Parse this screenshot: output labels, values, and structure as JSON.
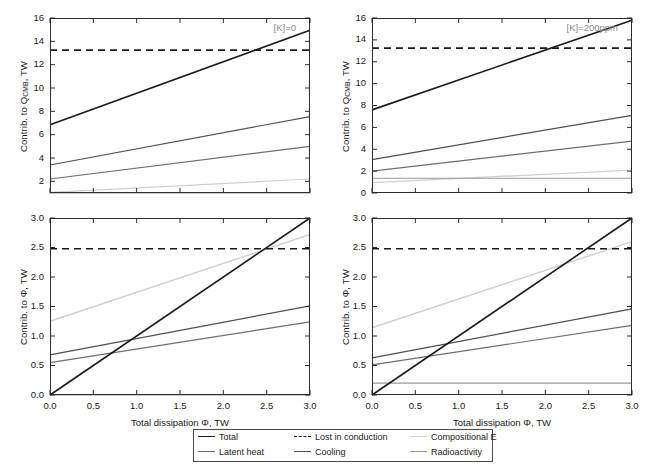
{
  "figure": {
    "background": "#ffffff",
    "width": 648,
    "height": 467
  },
  "series_styles": {
    "total": "#1a1a1a",
    "lost_in_conduction": "#1a1a1a",
    "compositional_e": "#d0d0d0",
    "latent_heat": "#6e6e6e",
    "cooling": "#505050",
    "radioactivity": "#9a9a9a"
  },
  "legend": {
    "entries": [
      {
        "label": "Total",
        "color": "#1a1a1a",
        "style": "solid",
        "icon": "line-solid-icon"
      },
      {
        "label": "Lost in conduction",
        "color": "#1a1a1a",
        "style": "dashed",
        "icon": "line-dashed-icon"
      },
      {
        "label": "Compositional E",
        "color": "#d0d0d0",
        "style": "solid",
        "icon": "line-solid-icon"
      },
      {
        "label": "Latent heat",
        "color": "#6e6e6e",
        "style": "solid",
        "icon": "line-solid-icon"
      },
      {
        "label": "Cooling",
        "color": "#505050",
        "style": "solid",
        "icon": "line-solid-icon"
      },
      {
        "label": "Radioactivity",
        "color": "#9a9a9a",
        "style": "solid",
        "icon": "line-solid-icon"
      }
    ]
  },
  "chart_data": [
    {
      "id": "top-left",
      "type": "line",
      "title": "",
      "annotation": "[K]=0",
      "xlabel": "",
      "ylabel": "Contrib. to Q_CMB, TW",
      "ylabel_parts": {
        "pre": "Contrib. to Q",
        "sub": "CMB",
        "post": ", TW"
      },
      "xlim": [
        0.0,
        3.0
      ],
      "ylim": [
        1.0,
        16.0
      ],
      "xticks": [
        0.0,
        0.5,
        1.0,
        1.5,
        2.0,
        2.5,
        3.0
      ],
      "xticklabels": [
        "",
        "",
        "",
        "",
        "",
        "",
        ""
      ],
      "yticks": [
        2,
        4,
        6,
        8,
        10,
        12,
        14,
        16
      ],
      "yticklabels": [
        "2",
        "4",
        "6",
        "8",
        "10",
        "12",
        "14",
        "16"
      ],
      "grid": false,
      "series": [
        {
          "name": "Total",
          "color": "#1a1a1a",
          "style": "solid",
          "width": 1.6,
          "x": [
            0.0,
            3.0
          ],
          "y": [
            6.85,
            14.95
          ]
        },
        {
          "name": "Lost in conduction",
          "color": "#1a1a1a",
          "style": "dashed",
          "width": 1.6,
          "x": [
            0.0,
            3.0
          ],
          "y": [
            13.25,
            13.25
          ]
        },
        {
          "name": "Cooling",
          "color": "#505050",
          "style": "solid",
          "width": 1.2,
          "x": [
            0.0,
            3.0
          ],
          "y": [
            3.4,
            7.55
          ]
        },
        {
          "name": "Latent heat",
          "color": "#6e6e6e",
          "style": "solid",
          "width": 1.2,
          "x": [
            0.0,
            3.0
          ],
          "y": [
            2.2,
            5.0
          ]
        },
        {
          "name": "Compositional E",
          "color": "#d0d0d0",
          "style": "solid",
          "width": 1.2,
          "x": [
            0.0,
            3.0
          ],
          "y": [
            1.05,
            2.2
          ]
        },
        {
          "name": "Radioactivity",
          "color": "#9a9a9a",
          "style": "solid",
          "width": 1.2,
          "x": [
            0.0,
            3.0
          ],
          "y": [
            1.0,
            1.0
          ]
        }
      ]
    },
    {
      "id": "top-right",
      "type": "line",
      "title": "",
      "annotation": "[K]=200ppm",
      "xlabel": "",
      "ylabel": "Contrib. to Q_CMB, TW",
      "ylabel_parts": {
        "pre": "Contrib. to Q",
        "sub": "CMB",
        "post": ", TW"
      },
      "xlim": [
        0.0,
        3.0
      ],
      "ylim": [
        0.0,
        16.0
      ],
      "xticks": [
        0.0,
        0.5,
        1.0,
        1.5,
        2.0,
        2.5,
        3.0
      ],
      "xticklabels": [
        "",
        "",
        "",
        "",
        "",
        "",
        ""
      ],
      "yticks": [
        0,
        2,
        4,
        6,
        8,
        10,
        12,
        14,
        16
      ],
      "yticklabels": [
        "0",
        "2",
        "4",
        "6",
        "8",
        "10",
        "12",
        "14",
        "16"
      ],
      "grid": false,
      "series": [
        {
          "name": "Total",
          "color": "#1a1a1a",
          "style": "solid",
          "width": 1.6,
          "x": [
            0.0,
            3.0
          ],
          "y": [
            7.6,
            15.8
          ]
        },
        {
          "name": "Lost in conduction",
          "color": "#1a1a1a",
          "style": "dashed",
          "width": 1.6,
          "x": [
            0.0,
            3.0
          ],
          "y": [
            13.25,
            13.25
          ]
        },
        {
          "name": "Cooling",
          "color": "#505050",
          "style": "solid",
          "width": 1.2,
          "x": [
            0.0,
            3.0
          ],
          "y": [
            3.05,
            7.1
          ]
        },
        {
          "name": "Latent heat",
          "color": "#6e6e6e",
          "style": "solid",
          "width": 1.2,
          "x": [
            0.0,
            3.0
          ],
          "y": [
            2.0,
            4.75
          ]
        },
        {
          "name": "Compositional E",
          "color": "#d0d0d0",
          "style": "solid",
          "width": 1.2,
          "x": [
            0.0,
            3.0
          ],
          "y": [
            0.95,
            2.1
          ]
        },
        {
          "name": "Radioactivity",
          "color": "#9a9a9a",
          "style": "solid",
          "width": 1.2,
          "x": [
            0.0,
            3.0
          ],
          "y": [
            1.35,
            1.35
          ]
        }
      ]
    },
    {
      "id": "bottom-left",
      "type": "line",
      "title": "",
      "annotation": "",
      "xlabel": "Total dissipation Φ, TW",
      "ylabel": "Contrib. to Φ, TW",
      "ylabel_parts": {
        "pre": "Contrib. to Φ, TW",
        "sub": "",
        "post": ""
      },
      "xlim": [
        0.0,
        3.0
      ],
      "ylim": [
        0.0,
        3.0
      ],
      "xticks": [
        0.0,
        0.5,
        1.0,
        1.5,
        2.0,
        2.5,
        3.0
      ],
      "xticklabels": [
        "0.0",
        "0.5",
        "1.0",
        "1.5",
        "2.0",
        "2.5",
        "3.0"
      ],
      "yticks": [
        0.0,
        0.5,
        1.0,
        1.5,
        2.0,
        2.5,
        3.0
      ],
      "yticklabels": [
        "0.0",
        "0.5",
        "1.0",
        "1.5",
        "2.0",
        "2.5",
        "3.0"
      ],
      "grid": false,
      "series": [
        {
          "name": "Total",
          "color": "#1a1a1a",
          "style": "solid",
          "width": 1.6,
          "x": [
            0.0,
            3.0
          ],
          "y": [
            0.0,
            3.0
          ]
        },
        {
          "name": "Lost in conduction",
          "color": "#1a1a1a",
          "style": "dashed",
          "width": 1.6,
          "x": [
            0.0,
            3.0
          ],
          "y": [
            2.48,
            2.48
          ]
        },
        {
          "name": "Compositional E",
          "color": "#d0d0d0",
          "style": "solid",
          "width": 1.4,
          "x": [
            0.0,
            3.0
          ],
          "y": [
            1.25,
            2.72
          ]
        },
        {
          "name": "Cooling",
          "color": "#505050",
          "style": "solid",
          "width": 1.2,
          "x": [
            0.0,
            3.0
          ],
          "y": [
            0.68,
            1.51
          ]
        },
        {
          "name": "Latent heat",
          "color": "#6e6e6e",
          "style": "solid",
          "width": 1.2,
          "x": [
            0.0,
            3.0
          ],
          "y": [
            0.55,
            1.24
          ]
        },
        {
          "name": "Radioactivity",
          "color": "#9a9a9a",
          "style": "solid",
          "width": 1.2,
          "x": [
            0.0,
            3.0
          ],
          "y": [
            0.0,
            0.0
          ]
        }
      ]
    },
    {
      "id": "bottom-right",
      "type": "line",
      "title": "",
      "annotation": "",
      "xlabel": "Total dissipation Φ, TW",
      "ylabel": "Contrib. to Φ, TW",
      "ylabel_parts": {
        "pre": "Contrib. to Φ, TW",
        "sub": "",
        "post": ""
      },
      "xlim": [
        0.0,
        3.0
      ],
      "ylim": [
        0.0,
        3.0
      ],
      "xticks": [
        0.0,
        0.5,
        1.0,
        1.5,
        2.0,
        2.5,
        3.0
      ],
      "xticklabels": [
        "0.0",
        "0.5",
        "1.0",
        "1.5",
        "2.0",
        "2.5",
        "3.0"
      ],
      "yticks": [
        0.0,
        0.5,
        1.0,
        1.5,
        2.0,
        2.5,
        3.0
      ],
      "yticklabels": [
        "0.0",
        "0.5",
        "1.0",
        "1.5",
        "2.0",
        "2.5",
        "3.0"
      ],
      "grid": false,
      "series": [
        {
          "name": "Total",
          "color": "#1a1a1a",
          "style": "solid",
          "width": 1.6,
          "x": [
            0.0,
            3.0
          ],
          "y": [
            0.0,
            3.0
          ]
        },
        {
          "name": "Lost in conduction",
          "color": "#1a1a1a",
          "style": "dashed",
          "width": 1.6,
          "x": [
            0.0,
            3.0
          ],
          "y": [
            2.48,
            2.48
          ]
        },
        {
          "name": "Compositional E",
          "color": "#d0d0d0",
          "style": "solid",
          "width": 1.4,
          "x": [
            0.0,
            3.0
          ],
          "y": [
            1.14,
            2.6
          ]
        },
        {
          "name": "Cooling",
          "color": "#505050",
          "style": "solid",
          "width": 1.2,
          "x": [
            0.0,
            3.0
          ],
          "y": [
            0.63,
            1.46
          ]
        },
        {
          "name": "Latent heat",
          "color": "#6e6e6e",
          "style": "solid",
          "width": 1.2,
          "x": [
            0.0,
            3.0
          ],
          "y": [
            0.51,
            1.18
          ]
        },
        {
          "name": "Radioactivity",
          "color": "#9a9a9a",
          "style": "solid",
          "width": 1.2,
          "x": [
            0.0,
            3.0
          ],
          "y": [
            0.2,
            0.2
          ]
        }
      ]
    }
  ]
}
